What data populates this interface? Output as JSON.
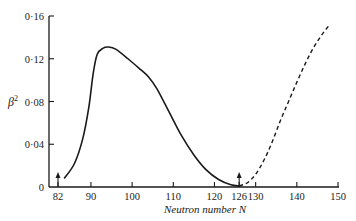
{
  "chart_data": {
    "type": "line",
    "title": "",
    "xlabel": "Neutron number N",
    "ylabel": "β²",
    "xlim": [
      82,
      150
    ],
    "ylim": [
      0,
      0.16
    ],
    "grid": false,
    "legend": null,
    "x_ticks": [
      {
        "value": 82,
        "label": "82"
      },
      {
        "value": 90,
        "label": "90"
      },
      {
        "value": 100,
        "label": "100"
      },
      {
        "value": 110,
        "label": "110"
      },
      {
        "value": 120,
        "label": "120"
      },
      {
        "value": 126,
        "label": "126"
      },
      {
        "value": 130,
        "label": "130"
      },
      {
        "value": 140,
        "label": "140"
      },
      {
        "value": 150,
        "label": "150"
      }
    ],
    "y_ticks": [
      {
        "value": 0,
        "label": "0"
      },
      {
        "value": 0.04,
        "label": "0·04"
      },
      {
        "value": 0.08,
        "label": "0·08"
      },
      {
        "value": 0.12,
        "label": "0·12"
      },
      {
        "value": 0.16,
        "label": "0·16"
      }
    ],
    "annotations": [
      {
        "type": "arrow",
        "x": 82,
        "label": "magic number 82"
      },
      {
        "type": "arrow",
        "x": 126,
        "label": "magic number 126"
      }
    ],
    "series": [
      {
        "name": "measured",
        "style": "solid",
        "x": [
          83.5,
          86,
          88,
          89.5,
          90.5,
          91.5,
          93,
          94.2,
          96,
          99,
          102,
          104,
          106,
          109,
          112,
          115,
          118,
          121,
          124,
          126
        ],
        "y": [
          0.008,
          0.022,
          0.045,
          0.075,
          0.105,
          0.124,
          0.13,
          0.131,
          0.129,
          0.12,
          0.11,
          0.103,
          0.092,
          0.07,
          0.048,
          0.03,
          0.016,
          0.007,
          0.002,
          0.001
        ]
      },
      {
        "name": "extrapolated",
        "style": "dashed",
        "x": [
          126,
          128,
          130,
          132,
          134,
          136,
          138,
          140,
          142,
          144,
          146,
          148
        ],
        "y": [
          0.001,
          0.004,
          0.012,
          0.025,
          0.042,
          0.062,
          0.08,
          0.098,
          0.115,
          0.13,
          0.142,
          0.152
        ]
      }
    ]
  }
}
